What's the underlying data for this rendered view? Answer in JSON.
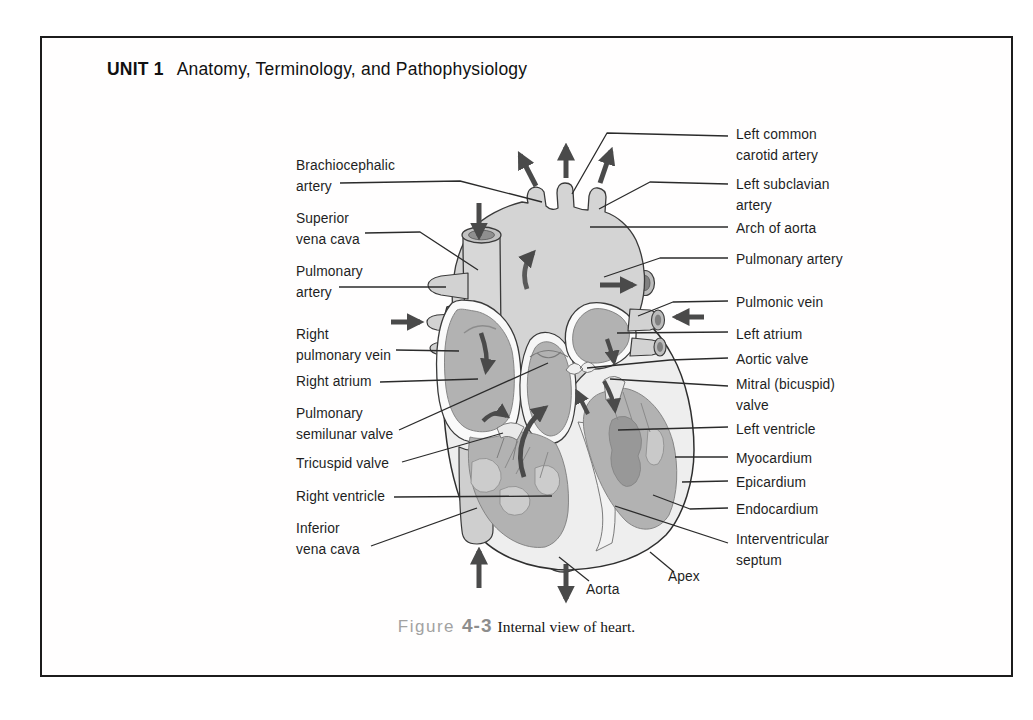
{
  "page": {
    "header": {
      "unit_label": "UNIT 1",
      "chapter_title": "Anatomy, Terminology, and Pathophysiology"
    },
    "figure_caption": {
      "prefix": "Figure",
      "number": "4-3",
      "title": "Internal view of heart."
    }
  },
  "diagram": {
    "type": "anatomical-diagram",
    "subject": "Internal view of heart",
    "labels_left": [
      "Brachiocephalic\nartery",
      "Superior\nvena cava",
      "Pulmonary\nartery",
      "Right\npulmonary vein",
      "Right atrium",
      "Pulmonary\nsemilunar valve",
      "Tricuspid valve",
      "Right ventricle",
      "Inferior\nvena cava"
    ],
    "labels_right": [
      "Left common\ncarotid artery",
      "Left subclavian\nartery",
      "Arch of aorta",
      "Pulmonary artery",
      "Pulmonic vein",
      "Left atrium",
      "Aortic valve",
      "Mitral (bicuspid)\nvalve",
      "Left ventricle",
      "Myocardium",
      "Epicardium",
      "Endocardium",
      "Interventricular\nseptum"
    ],
    "labels_bottom": [
      "Aorta",
      "Apex"
    ],
    "colors": {
      "arrow": "#4a4a4a",
      "vessel_fill": "#d4d4d4",
      "chamber_fill": "#b2b2b2",
      "heart_wall_fill": "#eeeeee",
      "outline": "#333333",
      "caption_accent": "#9a9a9a"
    }
  }
}
